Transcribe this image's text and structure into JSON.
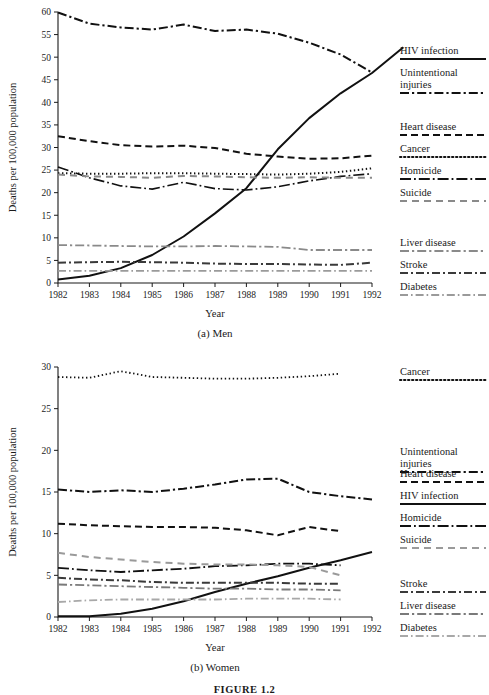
{
  "figure": {
    "label": "FIGURE 1.2",
    "panels": [
      {
        "id": "men",
        "caption": "(a) Men"
      },
      {
        "id": "women",
        "caption": "(b) Women"
      }
    ]
  },
  "chart_data": [
    {
      "type": "line",
      "panel": "men",
      "title": "(a) Men",
      "xlabel": "Year",
      "ylabel": "Deaths per 100,000 population",
      "x": [
        1982,
        1983,
        1984,
        1985,
        1986,
        1987,
        1988,
        1989,
        1990,
        1991,
        1992
      ],
      "xticklabels": [
        "1982",
        "1983",
        "1984",
        "1985",
        "1986",
        "1987",
        "1988",
        "1989",
        "1990",
        "1991",
        "1992"
      ],
      "yticklabels": [
        "0",
        "5",
        "10",
        "15",
        "20",
        "25",
        "30",
        "35",
        "40",
        "45",
        "50",
        "55",
        "60"
      ],
      "xlim": [
        1982,
        1992
      ],
      "ylim": [
        0,
        60
      ],
      "grid": false,
      "legend_position": "right",
      "series": [
        {
          "name": "HIV infection",
          "style": "solid",
          "color": "#111111",
          "width": 2.0,
          "values": [
            0.8,
            1.6,
            3.3,
            6.2,
            10.3,
            15.4,
            21.0,
            29.6,
            36.5,
            42.0,
            46.5,
            52.2
          ]
        },
        {
          "name": "Unintentional injuries",
          "style": "dash-dot",
          "color": "#111111",
          "width": 2.0,
          "values": [
            59.9,
            57.4,
            56.6,
            56.1,
            57.2,
            55.8,
            56.1,
            55.2,
            53.2,
            50.6,
            46.6
          ]
        },
        {
          "name": "Heart disease",
          "style": "dashed",
          "color": "#111111",
          "width": 2.0,
          "values": [
            32.5,
            31.4,
            30.5,
            30.2,
            30.4,
            29.9,
            28.6,
            28.0,
            27.5,
            27.6,
            28.2
          ]
        },
        {
          "name": "Cancer",
          "style": "dotted",
          "color": "#111111",
          "width": 2.0,
          "values": [
            24.3,
            24.2,
            24.2,
            24.3,
            24.3,
            24.2,
            24.1,
            24.0,
            24.2,
            24.6,
            25.4
          ]
        },
        {
          "name": "Homicide",
          "style": "long-dash-dot",
          "color": "#111111",
          "width": 1.6,
          "values": [
            25.7,
            23.3,
            21.5,
            20.8,
            22.3,
            20.9,
            20.6,
            21.3,
            22.6,
            23.6,
            24.2
          ]
        },
        {
          "name": "Suicide",
          "style": "long-dash",
          "color": "#8a8a8a",
          "width": 2.0,
          "values": [
            24.0,
            23.6,
            23.5,
            23.3,
            23.7,
            23.6,
            23.4,
            23.3,
            23.4,
            23.3,
            23.3
          ]
        },
        {
          "name": "Liver disease",
          "style": "dash-dot",
          "color": "#8a8a8a",
          "width": 1.8,
          "values": [
            8.4,
            8.3,
            8.2,
            8.1,
            8.1,
            8.2,
            8.1,
            8.0,
            7.3,
            7.3,
            7.3
          ]
        },
        {
          "name": "Stroke",
          "style": "dash-dot-thick",
          "color": "#3a3a3a",
          "width": 2.0,
          "values": [
            4.5,
            4.6,
            4.7,
            4.6,
            4.5,
            4.3,
            4.2,
            4.2,
            4.1,
            4.0,
            4.5
          ]
        },
        {
          "name": "Diabetes",
          "style": "dash-dot-fine",
          "color": "#9a9a9a",
          "width": 1.8,
          "values": [
            2.7,
            2.7,
            2.7,
            2.7,
            2.7,
            2.7,
            2.7,
            2.7,
            2.7,
            2.7,
            2.7
          ]
        }
      ],
      "legend": [
        {
          "label": "HIV infection",
          "style": "solid",
          "color": "#111111"
        },
        {
          "label": "Unintentional",
          "label2": "injuries",
          "style": "dash-dot",
          "color": "#111111"
        },
        {
          "label": "Heart disease",
          "style": "dashed",
          "color": "#111111"
        },
        {
          "label": "Cancer",
          "style": "dotted",
          "color": "#111111"
        },
        {
          "label": "Homicide",
          "style": "long-dash-dot",
          "color": "#111111"
        },
        {
          "label": "Suicide",
          "style": "long-dash",
          "color": "#8a8a8a"
        },
        {
          "label": "Liver disease",
          "style": "dash-dot",
          "color": "#8a8a8a"
        },
        {
          "label": "Stroke",
          "style": "dash-dot-thick",
          "color": "#3a3a3a"
        },
        {
          "label": "Diabetes",
          "style": "dash-dot-fine",
          "color": "#9a9a9a"
        }
      ]
    },
    {
      "type": "line",
      "panel": "women",
      "title": "(b) Women",
      "xlabel": "Year",
      "ylabel": "Deaths per 100,000 population",
      "x": [
        1982,
        1983,
        1984,
        1985,
        1986,
        1987,
        1988,
        1989,
        1990,
        1991,
        1992
      ],
      "xticklabels": [
        "1982",
        "1983",
        "1984",
        "1985",
        "1986",
        "1987",
        "1988",
        "1989",
        "1990",
        "1991",
        "1992"
      ],
      "yticklabels": [
        "0",
        "5",
        "10",
        "15",
        "20",
        "25",
        "30"
      ],
      "xlim": [
        1982,
        1992
      ],
      "ylim": [
        0,
        30
      ],
      "grid": false,
      "legend_position": "right",
      "series": [
        {
          "name": "Cancer",
          "style": "dotted",
          "color": "#111111",
          "width": 1.8,
          "values": [
            28.8,
            28.7,
            29.5,
            28.8,
            28.7,
            28.6,
            28.6,
            28.7,
            28.9,
            29.2
          ]
        },
        {
          "name": "Unintentional injuries",
          "style": "dash-dot",
          "color": "#111111",
          "width": 2.0,
          "values": [
            15.3,
            15.0,
            15.2,
            15.0,
            15.4,
            15.9,
            16.5,
            16.6,
            15.0,
            14.5,
            14.1
          ]
        },
        {
          "name": "Heart disease",
          "style": "dashed",
          "color": "#111111",
          "width": 2.0,
          "values": [
            11.2,
            11.0,
            10.9,
            10.8,
            10.8,
            10.7,
            10.4,
            9.8,
            10.8,
            10.3
          ]
        },
        {
          "name": "HIV infection",
          "style": "solid",
          "color": "#111111",
          "width": 2.0,
          "values": [
            0.1,
            0.1,
            0.4,
            1.0,
            1.9,
            3.0,
            4.0,
            4.9,
            5.9,
            6.8,
            7.8
          ]
        },
        {
          "name": "Homicide",
          "style": "long-dash-dot",
          "color": "#111111",
          "width": 1.8,
          "values": [
            5.9,
            5.6,
            5.4,
            5.6,
            5.8,
            6.1,
            6.2,
            6.4,
            6.4,
            6.2
          ]
        },
        {
          "name": "Suicide",
          "style": "long-dash",
          "color": "#9a9a9a",
          "width": 2.0,
          "values": [
            7.7,
            7.2,
            6.9,
            6.6,
            6.4,
            6.3,
            6.3,
            6.2,
            6.0,
            5.0
          ]
        },
        {
          "name": "Stroke",
          "style": "dash-dot-thick",
          "color": "#3a3a3a",
          "width": 2.0,
          "values": [
            4.7,
            4.5,
            4.4,
            4.2,
            4.1,
            4.1,
            4.1,
            4.1,
            4.0,
            4.0
          ]
        },
        {
          "name": "Liver disease",
          "style": "dash-dot",
          "color": "#7a7a7a",
          "width": 1.8,
          "values": [
            3.9,
            3.8,
            3.7,
            3.6,
            3.5,
            3.4,
            3.4,
            3.3,
            3.3,
            3.2
          ]
        },
        {
          "name": "Diabetes",
          "style": "dash-dot-fine",
          "color": "#a8a8a8",
          "width": 1.8,
          "values": [
            1.8,
            2.0,
            2.1,
            2.1,
            2.1,
            2.1,
            2.2,
            2.2,
            2.2,
            2.1
          ]
        }
      ],
      "legend": [
        {
          "label": "Cancer",
          "style": "dotted",
          "color": "#111111"
        },
        {
          "label": "Unintentional",
          "label2": "injuries",
          "style": "dash-dot",
          "color": "#111111"
        },
        {
          "label": "Heart disease",
          "style": "dashed",
          "color": "#111111"
        },
        {
          "label": "HIV infection",
          "style": "solid",
          "color": "#111111"
        },
        {
          "label": "Homicide",
          "style": "long-dash-dot",
          "color": "#111111"
        },
        {
          "label": "Suicide",
          "style": "long-dash",
          "color": "#9a9a9a"
        },
        {
          "label": "Stroke",
          "style": "dash-dot-thick",
          "color": "#3a3a3a"
        },
        {
          "label": "Liver disease",
          "style": "dash-dot",
          "color": "#7a7a7a"
        },
        {
          "label": "Diabetes",
          "style": "dash-dot-fine",
          "color": "#a8a8a8"
        }
      ]
    }
  ]
}
